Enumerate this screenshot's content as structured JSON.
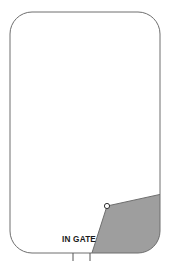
{
  "figure": {
    "type": "technical-plan-diagram",
    "background_color": "#ffffff"
  },
  "enclosure": {
    "name": "rounded-rectangle-boundary",
    "stroke_color": "#6e6e6e",
    "stroke_width": 1,
    "fill_color": "#ffffff",
    "x": 10,
    "y": 12,
    "width": 150,
    "height": 241,
    "corner_radius": 22
  },
  "shaded_region": {
    "name": "shaded-zone",
    "fill_color": "#9e9e9e",
    "stroke_color": "#6e6e6e",
    "stroke_width": 1,
    "description": "grey filled area occupying the lower-right portion of the enclosure"
  },
  "vertex_marker": {
    "name": "apex-circle-marker",
    "cx": 107,
    "cy": 206,
    "r": 2.6,
    "fill_color": "#ffffff",
    "stroke_color": "#333333",
    "stroke_width": 1
  },
  "annotations": {
    "gate_label": {
      "text": "IN GATE",
      "x": 62,
      "y": 242,
      "color": "#1a1a1a"
    },
    "tick_marks": [
      {
        "name": "tick-left",
        "x": 73,
        "y1": 253,
        "y2": 261
      },
      {
        "name": "tick-right",
        "x": 90,
        "y1": 253,
        "y2": 261
      }
    ],
    "tick_color": "#555555"
  }
}
